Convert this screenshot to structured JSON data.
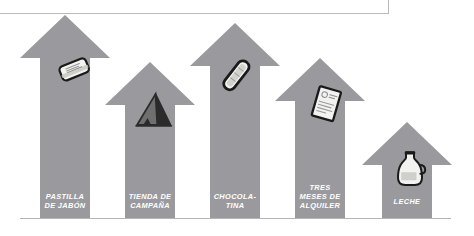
{
  "palette": {
    "arrow_fill": "#9a9a9e",
    "background": "#ffffff",
    "label_text": "#ffffff",
    "baseline": "#b5b5b8",
    "frame_border": "#b9b9bc",
    "icon_outline": "#1a1a1a",
    "icon_light": "#f2f2f0",
    "icon_mid": "#c9c9c4",
    "tent_dark": "#2b2b2b",
    "tent_mid": "#6f6f6f"
  },
  "chart_data": {
    "type": "bar",
    "title": "",
    "xlabel": "",
    "ylabel": "",
    "orientation": "vertical",
    "marker": "up-arrow",
    "categories": [
      "PASTILLA DE JABÓN",
      "TIENDA DE CAMPAÑA",
      "CHOCOLA- TINA",
      "TRES MESES DE ALQUILER",
      "LECHE"
    ],
    "values": [
      204,
      157,
      196,
      161,
      97
    ],
    "value_unit": "px of arrow height",
    "grid": false,
    "legend": null
  },
  "arrows": [
    {
      "id": "arrow-soap",
      "label": "PASTILLA\nDE JABÓN",
      "icon": "soap-bar-icon",
      "head_left": 20,
      "head_right": 110,
      "tip_y": 15,
      "head_bottom": 58,
      "shaft_left": 40,
      "shaft_right": 90,
      "base_y": 219,
      "label_x": 40,
      "label_y": 192,
      "label_w": 50,
      "icon_x": 50,
      "icon_y": 47,
      "icon_w": 48,
      "icon_h": 44
    },
    {
      "id": "arrow-tent",
      "label": "TIENDA DE\nCAMPAÑA",
      "icon": "tent-icon",
      "head_left": 105,
      "head_right": 195,
      "tip_y": 62,
      "head_bottom": 105,
      "shaft_left": 125,
      "shaft_right": 175,
      "base_y": 219,
      "label_x": 122,
      "label_y": 192,
      "label_w": 56,
      "icon_x": 128,
      "icon_y": 88,
      "icon_w": 48,
      "icon_h": 44
    },
    {
      "id": "arrow-chocolate",
      "label": "CHOCOLA-\nTINA",
      "icon": "chocolate-bar-icon",
      "head_left": 190,
      "head_right": 280,
      "tip_y": 23,
      "head_bottom": 66,
      "shaft_left": 210,
      "shaft_right": 260,
      "base_y": 219,
      "label_x": 205,
      "label_y": 192,
      "label_w": 60,
      "icon_x": 212,
      "icon_y": 52,
      "icon_w": 48,
      "icon_h": 46
    },
    {
      "id": "arrow-rent",
      "label": "TRES\nMESES DE\nALQUILER",
      "icon": "document-icon",
      "head_left": 275,
      "head_right": 365,
      "tip_y": 58,
      "head_bottom": 101,
      "shaft_left": 295,
      "shaft_right": 345,
      "base_y": 219,
      "label_x": 290,
      "label_y": 183,
      "label_w": 60,
      "icon_x": 302,
      "icon_y": 82,
      "icon_w": 48,
      "icon_h": 46
    },
    {
      "id": "arrow-milk",
      "label": "LECHE",
      "icon": "milk-jug-icon",
      "head_left": 362,
      "head_right": 452,
      "tip_y": 122,
      "head_bottom": 165,
      "shaft_left": 382,
      "shaft_right": 432,
      "base_y": 219,
      "label_x": 382,
      "label_y": 197,
      "label_w": 50,
      "icon_x": 390,
      "icon_y": 143,
      "icon_w": 40,
      "icon_h": 52
    }
  ]
}
